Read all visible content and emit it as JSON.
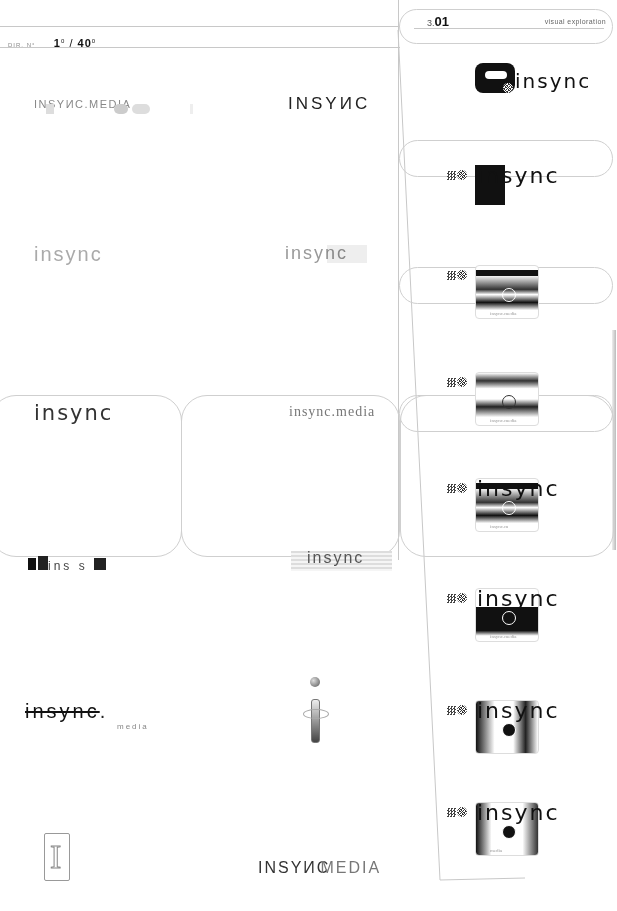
{
  "header": {
    "dir_label": "DIR. N°",
    "dir_current": "1",
    "dir_current_sup": "0",
    "dir_sep": "/",
    "dir_total": "40",
    "dir_total_sup": "0"
  },
  "section": {
    "number_prefix": "3.",
    "number": "01",
    "label": "visual exploration"
  },
  "logos_left": [
    {
      "text": "INSYИC.MEDIA",
      "style": "caps-light-with-blurred-shapes"
    },
    {
      "text": "insync",
      "style": "light-faded"
    },
    {
      "text": "insync",
      "style": "regular-wide"
    },
    {
      "text": "ins s",
      "style": "glitch-blocks"
    },
    {
      "text": "insync",
      "sub": "media",
      "style": "glitch-scrambled"
    },
    {
      "text": "I",
      "style": "outline-serif-monogram"
    }
  ],
  "logos_right": [
    {
      "text": "INSYИC",
      "style": "caps-wide"
    },
    {
      "text": "insync",
      "style": "light-with-inverted-block"
    },
    {
      "text": "insync.media",
      "style": "serif-broken"
    },
    {
      "text": "insync",
      "style": "striped-bar"
    },
    {
      "text": "i",
      "style": "globe-i-icon"
    },
    {
      "text": "INSYИC",
      "text2": "MEDIA",
      "style": "caps-overlap"
    }
  ],
  "explorations": [
    {
      "text": "insync",
      "caption": ""
    },
    {
      "text": "insync",
      "caption": "insync.media"
    },
    {
      "text": "insync",
      "caption": "insync.media"
    },
    {
      "text": "insync",
      "caption": "insync.media"
    },
    {
      "text": "insync",
      "caption": "insync.m"
    },
    {
      "text": "insync",
      "caption": "insync.media"
    },
    {
      "text": "insync",
      "caption": ""
    },
    {
      "text": "insync",
      "caption": "media"
    }
  ]
}
